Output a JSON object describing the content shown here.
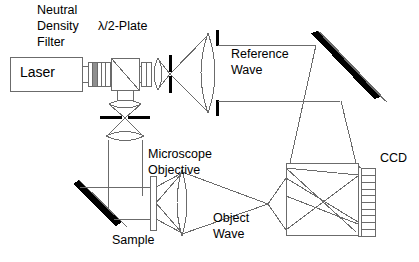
{
  "figure": {
    "background_color": "#ffffff",
    "line_color": "#6b6b6b",
    "text_color": "#000000",
    "mirror_color": "#000000"
  },
  "labels": {
    "nd_filter_line1": "Neutral",
    "nd_filter_line2": "Density",
    "nd_filter_line3": "Filter",
    "half_wave_plate": "λ/2-Plate",
    "laser": "Laser",
    "reference_wave_line1": "Reference",
    "reference_wave_line2": "Wave",
    "microscope_objective_line1": "Microscope",
    "microscope_objective_line2": "Objective",
    "object_wave_line1": "Object",
    "object_wave_line2": "Wave",
    "sample": "Sample",
    "ccd": "CCD"
  },
  "components": [
    {
      "name": "laser-source",
      "label": "Laser",
      "shape": "rectangle"
    },
    {
      "name": "neutral-density-filter",
      "label": "Neutral Density Filter",
      "shape": "filter-stack"
    },
    {
      "name": "half-wave-plate",
      "label": "λ/2-Plate",
      "shape": "plate"
    },
    {
      "name": "beam-splitter-cube",
      "label": "",
      "shape": "cube-with-diagonal"
    },
    {
      "name": "focusing-lens-reference",
      "label": "",
      "shape": "lens"
    },
    {
      "name": "pinhole-aperture-reference",
      "label": "",
      "shape": "aperture"
    },
    {
      "name": "collimating-lens-reference",
      "label": "",
      "shape": "lens"
    },
    {
      "name": "aperture-stop-reference",
      "label": "",
      "shape": "aperture"
    },
    {
      "name": "mirror-reference-top-right",
      "label": "",
      "shape": "tilted-mirror"
    },
    {
      "name": "focusing-lens-object",
      "label": "",
      "shape": "lens"
    },
    {
      "name": "pinhole-aperture-object",
      "label": "",
      "shape": "aperture"
    },
    {
      "name": "collimating-lens-object",
      "label": "",
      "shape": "lens"
    },
    {
      "name": "mirror-object-bottom-left",
      "label": "",
      "shape": "tilted-mirror"
    },
    {
      "name": "sample-plate",
      "label": "Sample",
      "shape": "plate"
    },
    {
      "name": "microscope-objective",
      "label": "Microscope Objective",
      "shape": "lens"
    },
    {
      "name": "beam-combiner-cube",
      "label": "",
      "shape": "cube"
    },
    {
      "name": "ccd-sensor",
      "label": "CCD",
      "shape": "pixel-array"
    }
  ],
  "ccd": {
    "pixel_count": 10
  }
}
